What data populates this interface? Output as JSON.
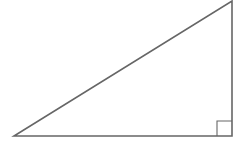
{
  "diagram": {
    "type": "right-triangle",
    "width": 244,
    "height": 145,
    "stroke_color": "#666666",
    "stroke_width": 1.6,
    "background": "#ffffff",
    "vertices": {
      "bottom_left": [
        14,
        136
      ],
      "bottom_right": [
        232,
        136
      ],
      "top_right": [
        232,
        1
      ]
    },
    "right_angle_marker": {
      "corner": "bottom_right",
      "size": 15,
      "stroke_width": 1.1
    }
  }
}
